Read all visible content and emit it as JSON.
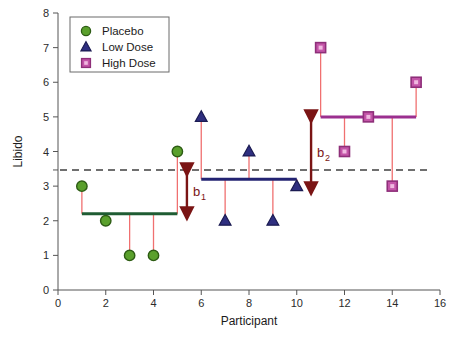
{
  "chart_data": {
    "type": "scatter",
    "title": "",
    "xlabel": "Participant",
    "ylabel": "Libido",
    "xlim": [
      0,
      16
    ],
    "ylim": [
      0,
      8
    ],
    "xticks": [
      0,
      2,
      4,
      6,
      8,
      10,
      12,
      14,
      16
    ],
    "yticks": [
      0,
      1,
      2,
      3,
      4,
      5,
      6,
      7,
      8
    ],
    "grid": false,
    "legend_position": "top-left",
    "x": [
      1,
      2,
      3,
      4,
      5,
      6,
      7,
      8,
      9,
      10,
      11,
      12,
      13,
      14,
      15
    ],
    "series": [
      {
        "name": "Placebo",
        "marker": "circle",
        "color": "#5aa02c",
        "edge_color": "#2d5c14",
        "x": [
          1,
          2,
          3,
          4,
          5
        ],
        "values": [
          3,
          2,
          1,
          1,
          4
        ],
        "group_mean": 2.2,
        "mean_line_color": "#1f5c33"
      },
      {
        "name": "Low Dose",
        "marker": "triangle",
        "color": "#2f2f80",
        "edge_color": "#1b1b52",
        "x": [
          6,
          7,
          8,
          9,
          10
        ],
        "values": [
          5,
          2,
          4,
          2,
          3
        ],
        "group_mean": 3.2,
        "mean_line_color": "#232372"
      },
      {
        "name": "High Dose",
        "marker": "square",
        "color": "#c455a8",
        "edge_color": "#8e2f79",
        "x": [
          11,
          12,
          13,
          14,
          15
        ],
        "values": [
          7,
          4,
          5,
          3,
          6
        ],
        "group_mean": 5.0,
        "mean_line_color": "#9b2f8f"
      }
    ],
    "grand_mean": 3.467,
    "grand_mean_style": "dashed",
    "grand_mean_color": "#404040",
    "residual_line_color": "#f07070",
    "annotations": [
      {
        "label": "b",
        "subscript": "1",
        "text": "b1",
        "from_value": 3.467,
        "to_value": 2.2,
        "at_x": 5.4,
        "color": "#7a1414"
      },
      {
        "label": "b",
        "subscript": "2",
        "text": "b2",
        "from_value": 5.0,
        "to_value": 2.92,
        "at_x": 10.6,
        "color": "#7a1414"
      }
    ]
  },
  "legend": {
    "items": [
      {
        "label": "Placebo"
      },
      {
        "label": "Low Dose"
      },
      {
        "label": "High Dose"
      }
    ]
  },
  "axes": {
    "x_title": "Participant",
    "y_title": "Libido",
    "x_tick_labels": [
      "0",
      "2",
      "4",
      "6",
      "8",
      "10",
      "12",
      "14",
      "16"
    ],
    "y_tick_labels": [
      "0",
      "1",
      "2",
      "3",
      "4",
      "5",
      "6",
      "7",
      "8"
    ]
  }
}
